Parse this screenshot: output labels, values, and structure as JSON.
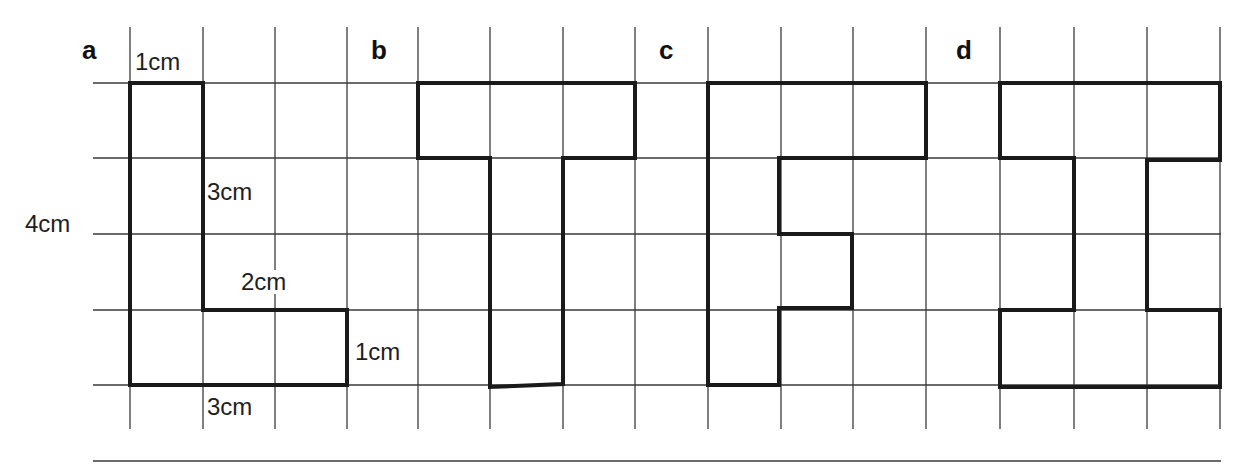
{
  "figure": {
    "grid": {
      "x_lines": [
        130,
        203,
        275,
        347,
        418,
        490,
        563,
        635,
        708,
        781,
        853,
        926,
        1000,
        1074,
        1147,
        1220
      ],
      "y_lines": [
        83,
        158,
        234,
        310,
        385
      ],
      "x_start": 93,
      "x_end": 1221,
      "y_start": 27,
      "y_end": 429,
      "line_color": "#3a3a3a"
    },
    "base_line": {
      "x1": 93,
      "x2": 1221,
      "y": 461
    },
    "shape_color": "#1a1a1a",
    "panels": [
      {
        "id": "a",
        "label": "a",
        "label_pos": {
          "x": 82,
          "y": 37
        },
        "outline": [
          [
            130,
            83
          ],
          [
            203,
            83
          ],
          [
            203,
            310
          ],
          [
            347,
            310
          ],
          [
            347,
            385
          ],
          [
            130,
            385
          ]
        ],
        "measurements": [
          {
            "text": "1cm",
            "x": 135,
            "y": 50,
            "bg": false
          },
          {
            "text": "3cm",
            "x": 207,
            "y": 180,
            "bg": false
          },
          {
            "text": "4cm",
            "x": 25,
            "y": 212,
            "bg": false
          },
          {
            "text": "2cm",
            "x": 240,
            "y": 270,
            "bg": true
          },
          {
            "text": "1cm",
            "x": 355,
            "y": 340,
            "bg": false
          },
          {
            "text": "3cm",
            "x": 207,
            "y": 395,
            "bg": false
          }
        ]
      },
      {
        "id": "b",
        "label": "b",
        "label_pos": {
          "x": 371,
          "y": 37
        },
        "outline": [
          [
            418,
            83
          ],
          [
            635,
            83
          ],
          [
            635,
            158
          ],
          [
            563,
            158
          ],
          [
            563,
            384
          ],
          [
            490,
            387
          ],
          [
            490,
            158
          ],
          [
            418,
            158
          ]
        ],
        "measurements": []
      },
      {
        "id": "c",
        "label": "c",
        "label_pos": {
          "x": 659,
          "y": 37
        },
        "outline": [
          [
            708,
            83
          ],
          [
            926,
            83
          ],
          [
            926,
            158
          ],
          [
            779,
            158
          ],
          [
            779,
            234
          ],
          [
            852,
            234
          ],
          [
            852,
            308
          ],
          [
            779,
            308
          ],
          [
            779,
            385
          ],
          [
            708,
            385
          ]
        ],
        "measurements": []
      },
      {
        "id": "d",
        "label": "d",
        "label_pos": {
          "x": 956,
          "y": 37
        },
        "outline": [
          [
            1000,
            83
          ],
          [
            1220,
            83
          ],
          [
            1220,
            160
          ],
          [
            1147,
            160
          ],
          [
            1147,
            310
          ],
          [
            1220,
            310
          ],
          [
            1220,
            387
          ],
          [
            1000,
            387
          ],
          [
            1000,
            310
          ],
          [
            1074,
            310
          ],
          [
            1074,
            158
          ],
          [
            1000,
            158
          ]
        ],
        "measurements": []
      }
    ]
  }
}
